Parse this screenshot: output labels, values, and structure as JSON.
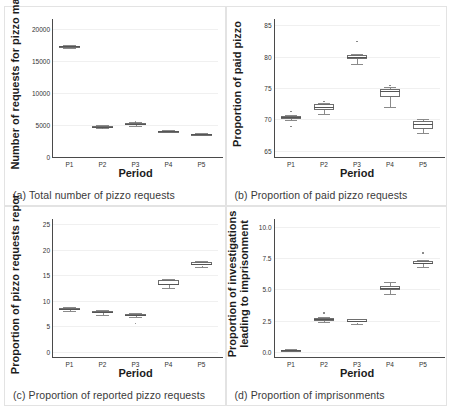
{
  "figure": {
    "shared_xlabel": "Period",
    "categories": [
      "P1",
      "P2",
      "P3",
      "P4",
      "P5"
    ]
  },
  "panels": [
    {
      "key": "a",
      "caption": "(a) Total number of pizzo requests",
      "ylabel": "Number of requests for pizzo ma",
      "ylabel_lines": [
        "Number of requests for pizzo ma"
      ],
      "xlabel": "Period",
      "yticks": [
        "0",
        "5000",
        "10000",
        "15000",
        "20000"
      ]
    },
    {
      "key": "b",
      "caption": "(b) Proportion of paid pizzo requests",
      "ylabel": "Proportion of paid pizzo",
      "ylabel_lines": [
        "Proportion of paid pizzo"
      ],
      "xlabel": "Period",
      "yticks": [
        "65",
        "70",
        "75",
        "80",
        "85"
      ]
    },
    {
      "key": "c",
      "caption": "(c) Proportion of reported pizzo requests",
      "ylabel": "Proportion of pizzo requests repor",
      "ylabel_lines": [
        "Proportion of pizzo requests repor"
      ],
      "xlabel": "Period",
      "yticks": [
        "0",
        "5",
        "10",
        "15",
        "20",
        "25"
      ]
    },
    {
      "key": "d",
      "caption": "(d) Proportion of imprisonments",
      "ylabel": "Proportion of investigations\nleading to imprisonment",
      "ylabel_lines": [
        "Proportion of investigations",
        "leading to imprisonment"
      ],
      "xlabel": "Period",
      "yticks": [
        "0.0",
        "2.5",
        "5.0",
        "7.5",
        "10.0"
      ]
    }
  ],
  "chart_data": [
    {
      "type": "box",
      "panel": "a",
      "title": "(a) Total number of pizzo requests",
      "xlabel": "Period",
      "ylabel": "Number of requests for pizzo ma",
      "categories": [
        "P1",
        "P2",
        "P3",
        "P4",
        "P5"
      ],
      "ylim": [
        0,
        21500
      ],
      "yticks": [
        0,
        5000,
        10000,
        15000,
        20000
      ],
      "grid": true,
      "boxes": [
        {
          "category": "P1",
          "min": 17000,
          "q1": 17150,
          "median": 17250,
          "q3": 17350,
          "max": 17500,
          "outliers": []
        },
        {
          "category": "P2",
          "min": 4500,
          "q1": 4650,
          "median": 4750,
          "q3": 4850,
          "max": 4950,
          "outliers": [
            4450
          ]
        },
        {
          "category": "P3",
          "min": 4900,
          "q1": 5050,
          "median": 5150,
          "q3": 5250,
          "max": 5400,
          "outliers": [
            5450
          ]
        },
        {
          "category": "P4",
          "min": 3900,
          "q1": 3980,
          "median": 4050,
          "q3": 4120,
          "max": 4200,
          "outliers": []
        },
        {
          "category": "P5",
          "min": 3350,
          "q1": 3450,
          "median": 3520,
          "q3": 3600,
          "max": 3680,
          "outliers": []
        }
      ]
    },
    {
      "type": "box",
      "panel": "b",
      "title": "(b) Proportion of paid pizzo requests",
      "xlabel": "Period",
      "ylabel": "Proportion of paid pizzo",
      "categories": [
        "P1",
        "P2",
        "P3",
        "P4",
        "P5"
      ],
      "ylim": [
        64,
        86
      ],
      "yticks": [
        65,
        70,
        75,
        80,
        85
      ],
      "grid": true,
      "boxes": [
        {
          "category": "P1",
          "min": 69.9,
          "q1": 70.1,
          "median": 70.3,
          "q3": 70.5,
          "max": 70.7,
          "outliers": [
            71.3,
            68.9
          ]
        },
        {
          "category": "P2",
          "min": 70.9,
          "q1": 71.5,
          "median": 71.9,
          "q3": 72.4,
          "max": 72.6,
          "outliers": [
            72.8
          ]
        },
        {
          "category": "P3",
          "min": 78.9,
          "q1": 79.6,
          "median": 79.9,
          "q3": 80.2,
          "max": 80.4,
          "outliers": [
            82.4
          ]
        },
        {
          "category": "P4",
          "min": 71.9,
          "q1": 73.5,
          "median": 74.5,
          "q3": 74.9,
          "max": 75.2,
          "outliers": [
            75.4
          ]
        },
        {
          "category": "P5",
          "min": 67.8,
          "q1": 68.4,
          "median": 69.3,
          "q3": 69.8,
          "max": 70.0,
          "outliers": []
        }
      ]
    },
    {
      "type": "box",
      "panel": "c",
      "title": "(c) Proportion of reported pizzo requests",
      "xlabel": "Period",
      "ylabel": "Proportion of pizzo requests repor",
      "categories": [
        "P1",
        "P2",
        "P3",
        "P4",
        "P5"
      ],
      "ylim": [
        -1,
        26
      ],
      "yticks": [
        0,
        5,
        10,
        15,
        20,
        25
      ],
      "grid": true,
      "boxes": [
        {
          "category": "P1",
          "min": 8.0,
          "q1": 8.2,
          "median": 8.4,
          "q3": 8.6,
          "max": 8.8,
          "outliers": []
        },
        {
          "category": "P2",
          "min": 7.2,
          "q1": 7.6,
          "median": 7.8,
          "q3": 8.0,
          "max": 8.2,
          "outliers": []
        },
        {
          "category": "P3",
          "min": 6.9,
          "q1": 7.1,
          "median": 7.3,
          "q3": 7.5,
          "max": 7.7,
          "outliers": [
            5.6
          ]
        },
        {
          "category": "P4",
          "min": 12.5,
          "q1": 13.0,
          "median": 13.3,
          "q3": 14.0,
          "max": 14.2,
          "outliers": []
        },
        {
          "category": "P5",
          "min": 16.6,
          "q1": 16.9,
          "median": 17.1,
          "q3": 17.6,
          "max": 17.8,
          "outliers": []
        }
      ]
    },
    {
      "type": "box",
      "panel": "d",
      "title": "(d) Proportion of imprisonments",
      "xlabel": "Period",
      "ylabel": "Proportion of investigations leading to imprisonment",
      "categories": [
        "P1",
        "P2",
        "P3",
        "P4",
        "P5"
      ],
      "ylim": [
        -0.4,
        10.6
      ],
      "yticks": [
        0.0,
        2.5,
        5.0,
        7.5,
        10.0
      ],
      "grid": true,
      "boxes": [
        {
          "category": "P1",
          "min": 0.1,
          "q1": 0.12,
          "median": 0.15,
          "q3": 0.18,
          "max": 0.2,
          "outliers": []
        },
        {
          "category": "P2",
          "min": 2.4,
          "q1": 2.5,
          "median": 2.6,
          "q3": 2.7,
          "max": 2.8,
          "outliers": [
            3.1
          ]
        },
        {
          "category": "P3",
          "min": 2.2,
          "q1": 2.35,
          "median": 2.45,
          "q3": 2.6,
          "max": 2.65,
          "outliers": []
        },
        {
          "category": "P4",
          "min": 4.6,
          "q1": 4.95,
          "median": 5.1,
          "q3": 5.25,
          "max": 5.6,
          "outliers": []
        },
        {
          "category": "P5",
          "min": 6.8,
          "q1": 7.0,
          "median": 7.1,
          "q3": 7.25,
          "max": 7.35,
          "outliers": [
            7.9
          ]
        }
      ]
    }
  ]
}
